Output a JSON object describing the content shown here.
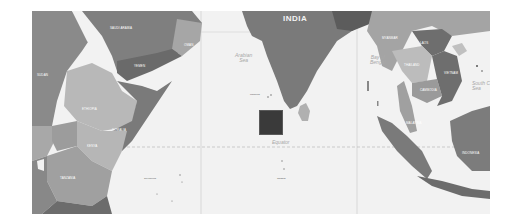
{
  "map": {
    "region": "Indian Ocean",
    "style": "grayscale political map",
    "colors": {
      "ocean": "#f2f2f2",
      "land_dark": "#7c7c7c",
      "land_mid": "#969696",
      "land_light": "#b4b4b4",
      "marker": "#3a3a3a",
      "gridline": "#c8c8c8"
    },
    "labels": {
      "india": "INDIA",
      "arabian_sea": "Arabian\nSea",
      "bay_of_bengal": "Bay of\nBengal",
      "equator": "Equator",
      "south_china_sea": "South C\nSea"
    },
    "countries": [
      {
        "name": "Saudi Arabia"
      },
      {
        "name": "Yemen"
      },
      {
        "name": "Oman"
      },
      {
        "name": "Sudan"
      },
      {
        "name": "Ethiopia"
      },
      {
        "name": "Somalia"
      },
      {
        "name": "Kenya"
      },
      {
        "name": "Tanzania"
      },
      {
        "name": "Myanmar"
      },
      {
        "name": "Laos"
      },
      {
        "name": "Thailand"
      },
      {
        "name": "Cambodia"
      },
      {
        "name": "Vietnam"
      },
      {
        "name": "Malaysia"
      },
      {
        "name": "Indonesia"
      }
    ],
    "islands": [
      {
        "name": "Maldives"
      },
      {
        "name": "Seychelles"
      },
      {
        "name": "Chagos"
      },
      {
        "name": "Sri Lanka"
      }
    ],
    "marker": {
      "shape": "square",
      "color": "#3a3a3a"
    }
  }
}
